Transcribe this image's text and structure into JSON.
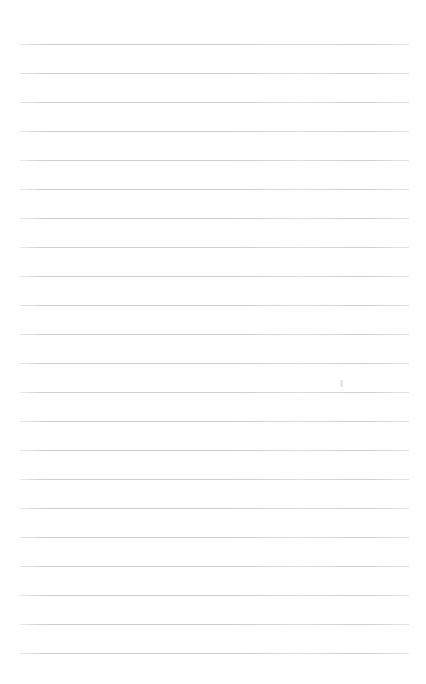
{
  "page": {
    "kind": "lined-notebook-page",
    "width": 426,
    "height": 684,
    "background_color": "#ffffff",
    "content_text": ""
  },
  "ruling": {
    "line_color": "#c8cbcd",
    "line_thickness_px": 1,
    "line_count": 22,
    "line_spacing_px": 29,
    "left_margin_px": 20,
    "right_margin_px": 17,
    "line_left_x": 20,
    "line_right_x": 409,
    "line_width_px": 389,
    "first_line_y": 44,
    "last_line_y": 653,
    "top_blank_margin_px": 44,
    "bottom_blank_margin_px": 31,
    "line_y_positions": [
      44,
      73,
      102,
      131,
      160,
      189,
      218,
      247,
      276,
      305,
      334,
      363,
      392,
      421,
      450,
      479,
      508,
      537,
      566,
      595,
      624,
      653
    ]
  },
  "marks": [
    {
      "name": "stray-pencil-mark",
      "x": 340,
      "y": 380,
      "width": 3,
      "height": 7,
      "color": "#e2e4e6"
    }
  ]
}
